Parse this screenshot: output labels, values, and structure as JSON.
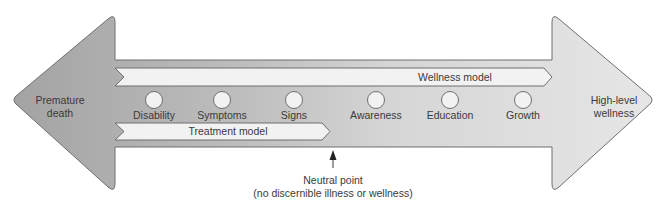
{
  "diagram": {
    "type": "illness-wellness continuum",
    "left_end": {
      "line1": "Premature",
      "line2": "death"
    },
    "right_end": {
      "line1": "High-level",
      "line2": "wellness"
    },
    "bands": {
      "wellness_model": "Wellness model",
      "treatment_model": "Treatment model"
    },
    "stages": [
      {
        "label": "Disability",
        "x": 154
      },
      {
        "label": "Symptoms",
        "x": 222
      },
      {
        "label": "Signs",
        "x": 294
      },
      {
        "label": "Awareness",
        "x": 376
      },
      {
        "label": "Education",
        "x": 450
      },
      {
        "label": "Growth",
        "x": 523
      }
    ],
    "neutral_point": {
      "line1": "Neutral point",
      "line2": "(no discernible illness or wellness)"
    },
    "colors": {
      "left_dark": "#a6a6a6",
      "right_light": "#e4e4e4",
      "band_fill": "#f2f2f2",
      "outline": "#6f6f6f",
      "text": "#3a3a3a"
    }
  }
}
